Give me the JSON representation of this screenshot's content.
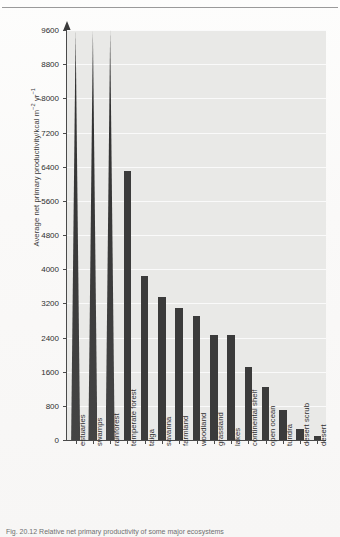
{
  "figure": {
    "caption_partial": "Fig. 20.12  Relative net primary productivity of some major ecosystems"
  },
  "chart_data": {
    "type": "bar",
    "title": "",
    "xlabel": "",
    "ylabel": "Average net primary productivity/kcal m⁻² yr⁻¹",
    "ylabel_main": "Average net primary productivity/kcal m",
    "ylabel_sup1": "−2",
    "ylabel_mid": " yr",
    "ylabel_sup2": "−1",
    "ylim": [
      0,
      9600
    ],
    "ytick_step": 800,
    "grid": true,
    "legend": "none",
    "axis_arrow": true,
    "note_clipped": "estuaries, swamps and rainforest bars extend beyond the top of the scale",
    "yticks": [
      "9600",
      "8800",
      "8000",
      "7200",
      "6400",
      "5600",
      "4800",
      "4000",
      "3200",
      "2400",
      "1600",
      "800",
      "0"
    ],
    "categories": [
      "estuaries",
      "swamps",
      "rainforest",
      "temperate forest",
      "taiga",
      "savanna",
      "farmland",
      "woodland",
      "grassland",
      "lakes",
      "continental shelf",
      "open ocean",
      "tundra",
      "desert scrub",
      "desert"
    ],
    "values": [
      9600,
      9600,
      9600,
      6300,
      3850,
      3350,
      3100,
      2900,
      2450,
      2450,
      1700,
      1250,
      700,
      250,
      100
    ],
    "clipped": [
      true,
      true,
      true,
      false,
      false,
      false,
      false,
      false,
      false,
      false,
      false,
      false,
      false,
      false,
      false
    ]
  },
  "colors": {
    "bar": "#3b3b3b",
    "plot_background": "#e9e9e7",
    "gridline": "#fafafa",
    "axis": "#4a4a4a",
    "page": "#fbfbfa",
    "text": "#2f2f2f"
  }
}
